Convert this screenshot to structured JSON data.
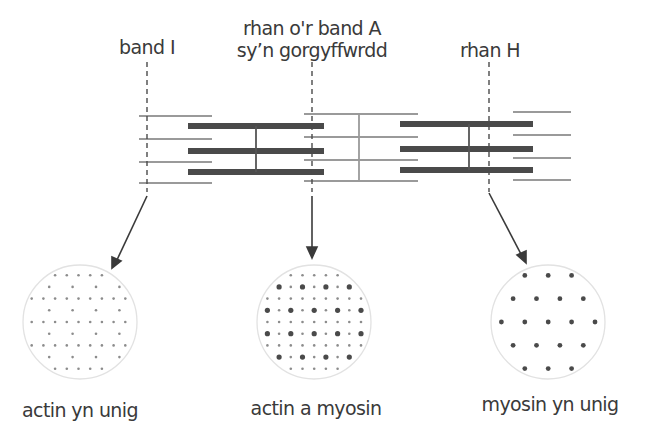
{
  "labels": {
    "band_i": "band I",
    "overlap_line1": "rhan o'r band A",
    "overlap_line2": "sy’n gorgyffwrdd",
    "h_zone": "rhan H"
  },
  "cross_sections": [
    {
      "caption": "actin yn unig",
      "content": "actin-only"
    },
    {
      "caption": "actin a myosin",
      "content": "actin-and-myosin"
    },
    {
      "caption": "myosin yn unig",
      "content": "myosin-only"
    }
  ],
  "colors": {
    "thick_filament": "#4a4a4a",
    "thin_filament": "#9a9a9a",
    "z_line": "#9a9a9a",
    "m_line": "#555555",
    "text": "#3a3a3a",
    "circle_outline": "#e2e2e2",
    "actin_dot": "#8c8c8c",
    "myosin_dot": "#4a4a4a"
  }
}
